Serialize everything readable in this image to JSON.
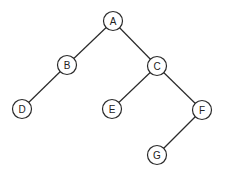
{
  "diagram": {
    "type": "binary-tree",
    "nodes": [
      {
        "id": "A",
        "label": "A",
        "x": 113,
        "y": 21
      },
      {
        "id": "B",
        "label": "B",
        "x": 67,
        "y": 65
      },
      {
        "id": "C",
        "label": "C",
        "x": 157,
        "y": 66
      },
      {
        "id": "D",
        "label": "D",
        "x": 22,
        "y": 109
      },
      {
        "id": "E",
        "label": "E",
        "x": 112,
        "y": 109
      },
      {
        "id": "F",
        "label": "F",
        "x": 202,
        "y": 110
      },
      {
        "id": "G",
        "label": "G",
        "x": 157,
        "y": 155
      }
    ],
    "edges": [
      {
        "from": "A",
        "to": "B"
      },
      {
        "from": "A",
        "to": "C"
      },
      {
        "from": "B",
        "to": "D"
      },
      {
        "from": "C",
        "to": "E"
      },
      {
        "from": "C",
        "to": "F"
      },
      {
        "from": "F",
        "to": "G"
      }
    ],
    "node_radius": 9.5
  }
}
